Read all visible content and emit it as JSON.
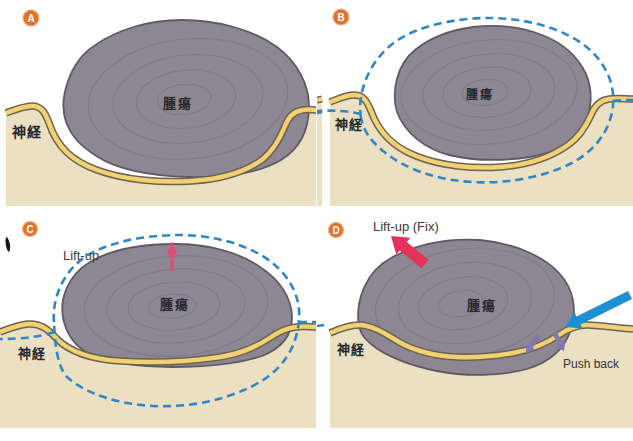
{
  "panels": [
    {
      "badge": "A",
      "nerve": "神経",
      "tumor": "腫瘍"
    },
    {
      "badge": "B",
      "nerve": "神経",
      "tumor": "腫瘍"
    },
    {
      "badge": "C",
      "nerve": "神経",
      "tumor": "腫瘍",
      "lift_label": "Lift-up"
    },
    {
      "badge": "D",
      "nerve": "神経",
      "tumor": "腫瘍",
      "lift_label": "Lift-up (Fix)",
      "push_label": "Push back"
    }
  ],
  "colors": {
    "badge": "#e2702e",
    "badge_ring": "#f2b07a",
    "tumor": "#8d8793",
    "tumor_outline": "#5f5964",
    "swirl": "#6f6979",
    "tissue": "#ece0c3",
    "nerve_fill": "#f2d173",
    "nerve_outline": "#6b6253",
    "dashed_margin": "#2f86c8",
    "lift_arrow": "#e63158",
    "blue_arrow": "#1e8fd4",
    "push_arrow": "#8179ad",
    "label_text": "#26262e"
  }
}
